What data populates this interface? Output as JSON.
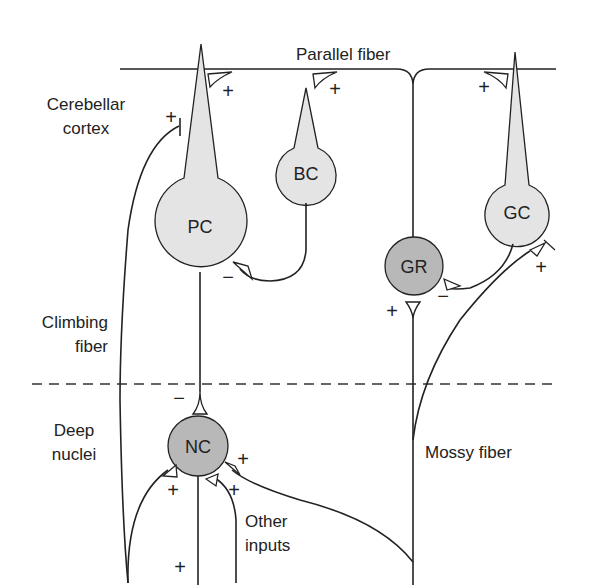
{
  "diagram": {
    "type": "cerebellar circuit schematic",
    "colors": {
      "line": "#222222",
      "light_cell": "#e4e4e4",
      "dark_cell": "#b8b8b8",
      "background": "#ffffff",
      "dashed_divider": "#333333"
    },
    "region_labels": {
      "cortex_line1": "Cerebellar",
      "cortex_line2": "cortex",
      "climbing_line1": "Climbing",
      "climbing_line2": "fiber",
      "deep_line1": "Deep",
      "deep_line2": "nuclei",
      "parallel_fiber": "Parallel fiber",
      "mossy_fiber": "Mossy fiber",
      "other_line1": "Other",
      "other_line2": "inputs"
    },
    "cells": [
      {
        "id": "PC",
        "label": "PC",
        "name": "Purkinje cell",
        "shade": "light"
      },
      {
        "id": "BC",
        "label": "BC",
        "name": "Basket cell",
        "shade": "light"
      },
      {
        "id": "GC",
        "label": "GC",
        "name": "Golgi cell",
        "shade": "light"
      },
      {
        "id": "GR",
        "label": "GR",
        "name": "Granule cell",
        "shade": "dark"
      },
      {
        "id": "NC",
        "label": "NC",
        "name": "Nuclear cell",
        "shade": "dark"
      }
    ],
    "signs": {
      "pf_pc": "+",
      "cf_pc": "+",
      "pf_bc": "+",
      "pf_gc": "+",
      "bc_pc": "−",
      "gc_gr": "−",
      "mf_gc": "+",
      "mf_gr": "+",
      "pc_nc": "−",
      "cf_nc": "+",
      "other_nc": "+",
      "mf_nc": "+",
      "nc_out": "+"
    }
  }
}
